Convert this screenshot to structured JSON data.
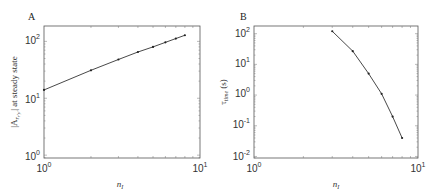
{
  "chart_data": [
    {
      "panel": "A",
      "type": "line",
      "xscale": "log",
      "yscale": "log",
      "xlabel": "n_I",
      "ylabel": "|A r_{r'y'}| at steady state",
      "xlim": [
        1,
        10
      ],
      "ylim": [
        1,
        150
      ],
      "x_ticks": [
        "10^0",
        "10^1"
      ],
      "y_ticks": [
        "10^0",
        "10^1",
        "10^2"
      ],
      "grid": false,
      "x": [
        1,
        2,
        3,
        4,
        5,
        6,
        7,
        8
      ],
      "values": [
        14,
        31,
        48,
        65,
        80,
        96,
        112,
        128
      ]
    },
    {
      "panel": "B",
      "type": "line",
      "xscale": "log",
      "yscale": "log",
      "xlabel": "n_I",
      "ylabel": "τ_time (s)",
      "xlim": [
        1,
        10
      ],
      "ylim": [
        0.01,
        150
      ],
      "x_ticks": [
        "10^0",
        "10^1"
      ],
      "y_ticks": [
        "10^-2",
        "10^-1",
        "10^0",
        "10^1",
        "10^2"
      ],
      "grid": false,
      "x": [
        3,
        4,
        5,
        6,
        7,
        8
      ],
      "values": [
        120,
        27,
        5,
        1.1,
        0.2,
        0.04
      ]
    }
  ],
  "panels": {
    "a": {
      "letter": "A",
      "xlabel": "n",
      "xsub": "I",
      "ylabel_pre": "|A",
      "ylabel_sub": "r",
      "ylabel_subsub": "r'y'",
      "ylabel_post": "| at steady state",
      "xticks": [
        {
          "base": "10",
          "exp": "0"
        },
        {
          "base": "10",
          "exp": "1"
        }
      ],
      "yticks": [
        {
          "base": "10",
          "exp": "0"
        },
        {
          "base": "10",
          "exp": "1"
        },
        {
          "base": "10",
          "exp": "2"
        }
      ]
    },
    "b": {
      "letter": "B",
      "xlabel": "n",
      "xsub": "I",
      "ylabel_pre": "τ",
      "ylabel_sub": "time",
      "ylabel_post": " (s)",
      "xticks": [
        {
          "base": "10",
          "exp": "0"
        },
        {
          "base": "10",
          "exp": "1"
        }
      ],
      "yticks": [
        {
          "base": "10",
          "exp": "-2"
        },
        {
          "base": "10",
          "exp": "-1"
        },
        {
          "base": "10",
          "exp": "0"
        },
        {
          "base": "10",
          "exp": "1"
        },
        {
          "base": "10",
          "exp": "2"
        }
      ]
    }
  }
}
